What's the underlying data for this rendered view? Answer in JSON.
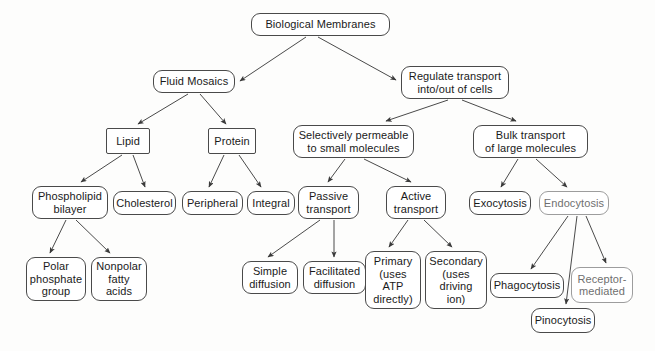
{
  "diagram": {
    "type": "hierarchy-tree",
    "canvas": {
      "width": 655,
      "height": 351
    },
    "style": {
      "background": "#fdfdfc",
      "node_fill": "#ffffff",
      "node_stroke": "#4a4a4a",
      "edge_stroke": "#4a4a4a",
      "text_color": "#1a1a1a"
    },
    "nodes": [
      {
        "id": "bio_membranes",
        "label": "Biological Membranes",
        "shape": "rounded",
        "x": 251,
        "y": 13,
        "w": 139,
        "h": 23
      },
      {
        "id": "fluid_mosaics",
        "label": "Fluid Mosaics",
        "shape": "rounded",
        "x": 153,
        "y": 70,
        "w": 82,
        "h": 23
      },
      {
        "id": "regulate",
        "label": "Regulate transport\ninto/out of cells",
        "shape": "rounded",
        "x": 401,
        "y": 66,
        "w": 108,
        "h": 33
      },
      {
        "id": "lipid",
        "label": "Lipid",
        "shape": "sharp",
        "x": 106,
        "y": 128,
        "w": 44,
        "h": 26
      },
      {
        "id": "protein",
        "label": "Protein",
        "shape": "sharp",
        "x": 208,
        "y": 128,
        "w": 48,
        "h": 26
      },
      {
        "id": "selectively",
        "label": "Selectively permeable\nto small molecules",
        "shape": "rounded",
        "x": 293,
        "y": 125,
        "w": 121,
        "h": 33
      },
      {
        "id": "bulk",
        "label": "Bulk transport\nof large molecules",
        "shape": "rounded",
        "x": 473,
        "y": 125,
        "w": 115,
        "h": 33
      },
      {
        "id": "phospholipid",
        "label": "Phospholipid\nbilayer",
        "shape": "rounded",
        "x": 32,
        "y": 186,
        "w": 76,
        "h": 33
      },
      {
        "id": "cholesterol",
        "label": "Cholesterol",
        "shape": "rounded",
        "x": 113,
        "y": 191,
        "w": 63,
        "h": 24
      },
      {
        "id": "peripheral",
        "label": "Peripheral",
        "shape": "rounded",
        "x": 182,
        "y": 191,
        "w": 61,
        "h": 24
      },
      {
        "id": "integral",
        "label": "Integral",
        "shape": "rounded",
        "x": 247,
        "y": 191,
        "w": 48,
        "h": 24
      },
      {
        "id": "passive",
        "label": "Passive\ntransport",
        "shape": "rounded",
        "x": 298,
        "y": 186,
        "w": 61,
        "h": 33
      },
      {
        "id": "active",
        "label": "Active\ntransport",
        "shape": "rounded",
        "x": 386,
        "y": 186,
        "w": 60,
        "h": 33
      },
      {
        "id": "exocytosis",
        "label": "Exocytosis",
        "shape": "rounded",
        "x": 469,
        "y": 191,
        "w": 62,
        "h": 24
      },
      {
        "id": "endocytosis",
        "label": "Endocytosis",
        "shape": "rounded",
        "x": 539,
        "y": 191,
        "w": 70,
        "h": 24,
        "faint": true
      },
      {
        "id": "polar",
        "label": "Polar\nphosphate\ngroup",
        "shape": "rounded",
        "x": 26,
        "y": 257,
        "w": 60,
        "h": 44
      },
      {
        "id": "nonpolar",
        "label": "Nonpolar\nfatty\nacids",
        "shape": "rounded",
        "x": 91,
        "y": 257,
        "w": 56,
        "h": 44
      },
      {
        "id": "simple_diff",
        "label": "Simple\ndiffusion",
        "shape": "rounded",
        "x": 242,
        "y": 261,
        "w": 56,
        "h": 33
      },
      {
        "id": "facilitated",
        "label": "Facilitated\ndiffusion",
        "shape": "rounded",
        "x": 303,
        "y": 261,
        "w": 63,
        "h": 33
      },
      {
        "id": "primary",
        "label": "Primary\n(uses\nATP\ndirectly)",
        "shape": "rounded",
        "x": 365,
        "y": 251,
        "w": 56,
        "h": 58
      },
      {
        "id": "secondary",
        "label": "Secondary\n(uses\ndriving\nion)",
        "shape": "rounded",
        "x": 425,
        "y": 251,
        "w": 62,
        "h": 58
      },
      {
        "id": "phagocytosis",
        "label": "Phagocytosis",
        "shape": "rounded",
        "x": 490,
        "y": 273,
        "w": 74,
        "h": 25
      },
      {
        "id": "receptor",
        "label": "Receptor-\nmediated",
        "shape": "rounded",
        "x": 571,
        "y": 267,
        "w": 62,
        "h": 36,
        "faint": true
      },
      {
        "id": "pinocytosis",
        "label": "Pinocytosis",
        "shape": "rounded",
        "x": 531,
        "y": 308,
        "w": 64,
        "h": 25
      }
    ],
    "edges": [
      {
        "from": "bio_membranes",
        "to": "fluid_mosaics",
        "x1": 306,
        "y1": 37,
        "x2": 240,
        "y2": 81
      },
      {
        "from": "bio_membranes",
        "to": "regulate",
        "x1": 318,
        "y1": 37,
        "x2": 396,
        "y2": 80
      },
      {
        "from": "fluid_mosaics",
        "to": "lipid",
        "x1": 188,
        "y1": 94,
        "x2": 138,
        "y2": 124
      },
      {
        "from": "fluid_mosaics",
        "to": "protein",
        "x1": 200,
        "y1": 94,
        "x2": 226,
        "y2": 124
      },
      {
        "from": "regulate",
        "to": "selectively",
        "x1": 448,
        "y1": 100,
        "x2": 386,
        "y2": 121
      },
      {
        "from": "regulate",
        "to": "bulk",
        "x1": 462,
        "y1": 100,
        "x2": 516,
        "y2": 121
      },
      {
        "from": "lipid",
        "to": "phospholipid",
        "x1": 122,
        "y1": 155,
        "x2": 81,
        "y2": 182
      },
      {
        "from": "lipid",
        "to": "cholesterol",
        "x1": 133,
        "y1": 155,
        "x2": 145,
        "y2": 187
      },
      {
        "from": "protein",
        "to": "peripheral",
        "x1": 224,
        "y1": 155,
        "x2": 209,
        "y2": 187
      },
      {
        "from": "protein",
        "to": "integral",
        "x1": 239,
        "y1": 155,
        "x2": 261,
        "y2": 187
      },
      {
        "from": "selectively",
        "to": "passive",
        "x1": 345,
        "y1": 159,
        "x2": 328,
        "y2": 182
      },
      {
        "from": "selectively",
        "to": "active",
        "x1": 364,
        "y1": 159,
        "x2": 411,
        "y2": 182
      },
      {
        "from": "bulk",
        "to": "exocytosis",
        "x1": 518,
        "y1": 159,
        "x2": 501,
        "y2": 187
      },
      {
        "from": "bulk",
        "to": "endocytosis",
        "x1": 536,
        "y1": 159,
        "x2": 567,
        "y2": 187
      },
      {
        "from": "phospholipid",
        "to": "polar",
        "x1": 66,
        "y1": 220,
        "x2": 50,
        "y2": 253
      },
      {
        "from": "phospholipid",
        "to": "nonpolar",
        "x1": 76,
        "y1": 220,
        "x2": 110,
        "y2": 253
      },
      {
        "from": "passive",
        "to": "simple_diff",
        "x1": 320,
        "y1": 220,
        "x2": 268,
        "y2": 257
      },
      {
        "from": "passive",
        "to": "facilitated",
        "x1": 334,
        "y1": 220,
        "x2": 334,
        "y2": 257
      },
      {
        "from": "active",
        "to": "primary",
        "x1": 408,
        "y1": 220,
        "x2": 389,
        "y2": 247
      },
      {
        "from": "active",
        "to": "secondary",
        "x1": 424,
        "y1": 220,
        "x2": 452,
        "y2": 247
      },
      {
        "from": "endocytosis",
        "to": "phagocytosis",
        "x1": 568,
        "y1": 216,
        "x2": 531,
        "y2": 269
      },
      {
        "from": "endocytosis",
        "to": "pinocytosis",
        "x1": 577,
        "y1": 216,
        "x2": 566,
        "y2": 304
      },
      {
        "from": "endocytosis",
        "to": "receptor",
        "x1": 586,
        "y1": 216,
        "x2": 606,
        "y2": 263
      }
    ]
  }
}
